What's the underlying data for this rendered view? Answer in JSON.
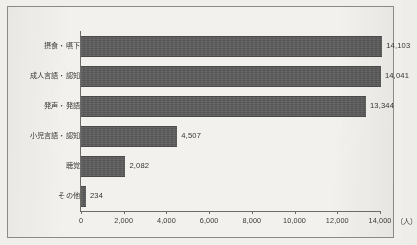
{
  "chart_data": {
    "type": "bar",
    "orientation": "horizontal",
    "title": "",
    "subtitle": "",
    "xlabel": "（人）",
    "ylabel": "",
    "categories": [
      "摂食・嚥下",
      "成人言語・認知",
      "発声・発語",
      "小児言語・認知",
      "聴覚",
      "その他"
    ],
    "values": [
      14103,
      14041,
      13344,
      4507,
      2082,
      234
    ],
    "value_labels": [
      "14,103",
      "14,041",
      "13,344",
      "4,507",
      "2,082",
      "234"
    ],
    "xlim": [
      0,
      14000
    ],
    "xticks": [
      0,
      2000,
      4000,
      6000,
      8000,
      10000,
      12000,
      14000
    ],
    "xtick_labels": [
      "0",
      "2,000",
      "4,000",
      "6,000",
      "8,000",
      "10,000",
      "12,000",
      "14,000"
    ],
    "unit_suffix": "（人）",
    "grid": false,
    "legend": false,
    "legend_position": "none",
    "series": [
      {
        "name": "",
        "values": [
          14103,
          14041,
          13344,
          4507,
          2082,
          234
        ]
      }
    ]
  },
  "colors": {
    "bar_fill": "#5b5b5b",
    "bar_edge": "#4a4a4a",
    "axis_line": "#6e6c69",
    "text": "#3b3a38",
    "page_background": "#f1efec",
    "plot_background": "#f3f1ee",
    "frame_border": "#8c8a87"
  }
}
